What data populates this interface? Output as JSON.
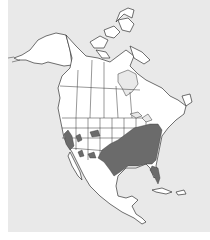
{
  "map": {
    "region": "North America",
    "type": "species range map",
    "colors": {
      "ocean": "#e9e9e9",
      "land": "#ffffff",
      "range": "#6b6b6b",
      "outline": "#333333"
    },
    "range_areas": [
      "Southeastern and central United States",
      "Central California",
      "Nevada / Utah patch",
      "Colorado / Wyoming patch",
      "New Mexico / Arizona patches"
    ]
  }
}
